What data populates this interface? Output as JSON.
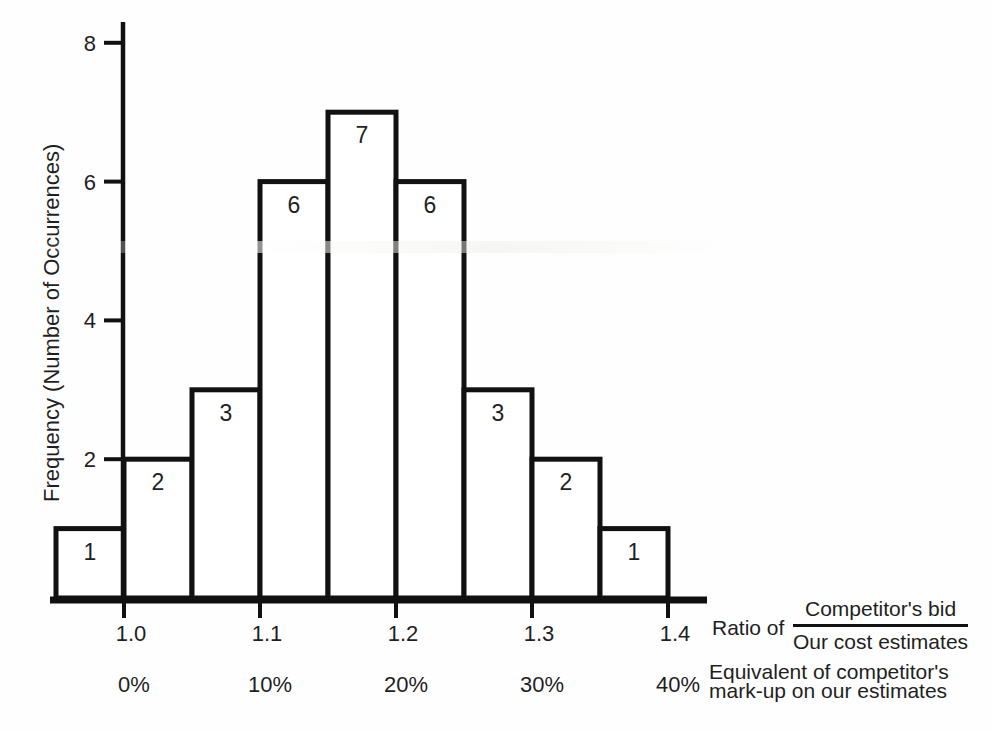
{
  "chart_data": {
    "type": "bar",
    "subtype": "histogram",
    "title": "",
    "ylabel": "Frequency (Number of Occurrences)",
    "y_ticks": [
      2,
      4,
      6,
      8
    ],
    "ylim": [
      0,
      8.3
    ],
    "bin_edges_ratio": [
      0.95,
      1.0,
      1.05,
      1.1,
      1.15,
      1.2,
      1.25,
      1.3,
      1.35,
      1.4
    ],
    "values": [
      1,
      2,
      3,
      6,
      7,
      6,
      3,
      2,
      1
    ],
    "bar_value_labels": [
      "1",
      "2",
      "3",
      "6",
      "7",
      "6",
      "3",
      "2",
      "1"
    ],
    "x_ticks": [
      {
        "ratio": "1.0",
        "percent": "0%"
      },
      {
        "ratio": "1.1",
        "percent": "10%"
      },
      {
        "ratio": "1.2",
        "percent": "20%"
      },
      {
        "ratio": "1.3",
        "percent": "30%"
      },
      {
        "ratio": "1.4",
        "percent": "40%"
      }
    ],
    "x_axis_label_prefix": "Ratio of",
    "fraction": {
      "numerator": "Competitor's bid",
      "denominator": "Our cost estimates"
    },
    "x_secondary_label": {
      "line1": "Equivalent of competitor's",
      "line2": "mark-up on our estimates"
    },
    "grid": "off",
    "legend": "none",
    "style": {
      "stroke": "#111111",
      "text_color": "#1f1f1f",
      "bar_fill": "#ffffff",
      "background": "#fefefe"
    }
  }
}
